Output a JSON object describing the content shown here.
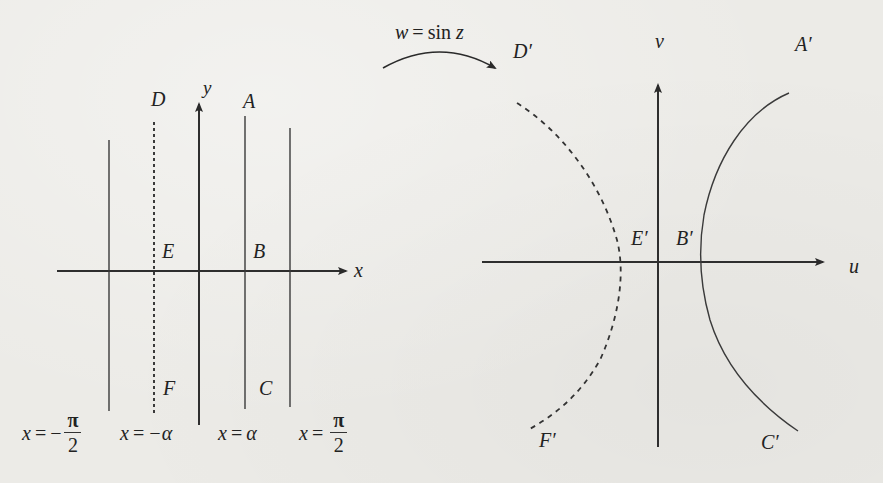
{
  "figure": {
    "mapping_label": "w = sin z",
    "mapping_label_parts": {
      "lhs": "w",
      "eq": "=",
      "fn": "sin",
      "arg": "z"
    },
    "z_plane": {
      "axis_labels": {
        "horizontal": "x",
        "vertical": "y"
      },
      "point_labels": {
        "D": "D",
        "A": "A",
        "E": "E",
        "B": "B",
        "F": "F",
        "C": "C"
      },
      "vertical_lines": [
        {
          "equation": "x = −π/2",
          "lhs": "x",
          "sign": "−",
          "num": "π",
          "den": "2",
          "style": "solid"
        },
        {
          "equation": "x = −α",
          "lhs": "x",
          "rhs": "−α",
          "style": "dashed"
        },
        {
          "equation": "x = α",
          "lhs": "x",
          "rhs": "α",
          "style": "solid"
        },
        {
          "equation": "x = π/2",
          "lhs": "x",
          "num": "π",
          "den": "2",
          "style": "solid"
        }
      ]
    },
    "w_plane": {
      "axis_labels": {
        "horizontal": "u",
        "vertical": "v"
      },
      "point_labels": {
        "D": "D′",
        "A": "A′",
        "E": "E′",
        "B": "B′",
        "F": "F′",
        "C": "C′"
      },
      "curves": [
        {
          "name": "left-hyperbola-branch",
          "style": "dashed",
          "through": [
            "D′",
            "E′",
            "F′"
          ]
        },
        {
          "name": "right-hyperbola-branch",
          "style": "solid",
          "through": [
            "A′",
            "B′",
            "C′"
          ]
        }
      ]
    },
    "colors": {
      "paper": "#ecebe7",
      "ink": "#222222"
    }
  }
}
